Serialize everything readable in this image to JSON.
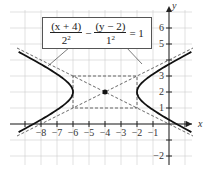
{
  "chart_data": {
    "type": "line",
    "title": "",
    "equation": {
      "term1_num": "(x + 4)",
      "term1_den": "2",
      "term2_num": "(y − 2)",
      "term2_den": "1",
      "minus": "−",
      "rhs": "= 1"
    },
    "center": [
      -4,
      2
    ],
    "a": 2,
    "b": 1,
    "vertices": [
      [
        -6,
        2
      ],
      [
        -2,
        2
      ]
    ],
    "asymptotes": [
      "y - 2 = 0.5(x + 4)",
      "y - 2 = -0.5(x + 4)"
    ],
    "xlabel": "x",
    "ylabel": "y",
    "x_ticks": [
      "−8",
      "−7",
      "−6",
      "−5",
      "−4",
      "−3",
      "−2",
      "−1"
    ],
    "y_ticks": [
      "6",
      "5",
      "3",
      "2",
      "1",
      "−2"
    ],
    "xlim": [
      -9.5,
      1.5
    ],
    "ylim": [
      -2.5,
      7
    ],
    "grid": true
  }
}
